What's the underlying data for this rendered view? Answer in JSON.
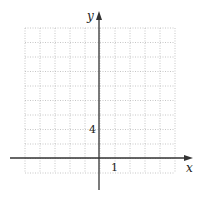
{
  "figure": {
    "type": "coordinate-grid",
    "axes": {
      "x_label": "x",
      "y_label": "y",
      "x_tick_label": "1",
      "y_tick_label": "4",
      "x_tick_unit": 1,
      "y_tick_unit": 2
    },
    "grid": {
      "columns": 10,
      "rows": 10,
      "style": "dotted",
      "color": "#b8b8b8"
    },
    "axis_color": "#333333"
  }
}
